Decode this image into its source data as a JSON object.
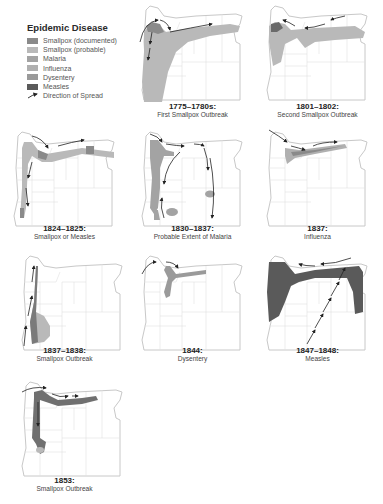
{
  "legend": {
    "title": "Epidemic Disease",
    "items": [
      {
        "label": "Smallpox (documented)",
        "color": "#8a8a8a",
        "type": "swatch"
      },
      {
        "label": "Smallpox (probable)",
        "color": "#b9b9b9",
        "type": "swatch"
      },
      {
        "label": "Malaria",
        "color": "#a3a3a3",
        "type": "swatch"
      },
      {
        "label": "Influenza",
        "color": "#b0b0b0",
        "type": "swatch"
      },
      {
        "label": "Dysentery",
        "color": "#9a9a9a",
        "type": "swatch"
      },
      {
        "label": "Measles",
        "color": "#5a5a5a",
        "type": "swatch"
      },
      {
        "label": "Direction of Spread",
        "color": "#222222",
        "type": "arrow"
      }
    ]
  },
  "panels": [
    {
      "id": "p1",
      "year": "1775–1780s:",
      "desc": "First Smallpox Outbreak",
      "disease": "smallpox"
    },
    {
      "id": "p2",
      "year": "1801–1802:",
      "desc": "Second Smallpox Outbreak",
      "disease": "smallpox"
    },
    {
      "id": "p3",
      "year": "1824–1825:",
      "desc": "Smallpox or Measles",
      "disease": "smallpox-or-measles"
    },
    {
      "id": "p4",
      "year": "1830–1837:",
      "desc": "Probable Extent of Malaria",
      "disease": "malaria"
    },
    {
      "id": "p5",
      "year": "1837:",
      "desc": "Influenza",
      "disease": "influenza"
    },
    {
      "id": "p6",
      "year": "1837–1838:",
      "desc": "Smallpox Outbreak",
      "disease": "smallpox"
    },
    {
      "id": "p7",
      "year": "1844:",
      "desc": "Dysentery",
      "disease": "dysentery"
    },
    {
      "id": "p8",
      "year": "1847–1848:",
      "desc": "Measles",
      "disease": "measles"
    },
    {
      "id": "p9",
      "year": "1853:",
      "desc": "Smallpox Outbreak",
      "disease": "smallpox"
    }
  ],
  "colors": {
    "state_outline": "#c8c8c8",
    "county_lines": "#dedede",
    "arrow": "#222222"
  }
}
